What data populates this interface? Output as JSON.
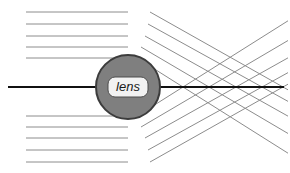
{
  "diagram": {
    "type": "optics-ray-diagram",
    "width": 290,
    "height": 173,
    "background_color": "#ffffff"
  },
  "lens": {
    "label": "lens",
    "shape": "circle",
    "center_x": 128,
    "center_y": 87,
    "radius": 32,
    "fill_color": "#7f7f7f",
    "stroke_color": "#3c3c3c",
    "stroke_width": 2,
    "label_box": {
      "fill_color": "#f2f2f2",
      "stroke_color": "#4d4d4d",
      "x": 108,
      "y": 77,
      "width": 40,
      "height": 20,
      "corner_radius": 7
    }
  },
  "axis": {
    "name": "optical-axis",
    "color": "#111111",
    "stroke_width": 2,
    "x_start": 8,
    "x_end": 284,
    "y": 87
  },
  "rays": {
    "color": "#8c8c8c",
    "stroke_width": 1,
    "incoming_x_start": 26,
    "lens_plane_x": 128,
    "above": [
      {
        "y": 12,
        "lens_exit_x": 150,
        "focus_x": 283
      },
      {
        "y": 24,
        "lens_exit_x": 148,
        "focus_x": 262
      },
      {
        "y": 36,
        "lens_exit_x": 145,
        "focus_x": 236
      },
      {
        "y": 47,
        "lens_exit_x": 141,
        "focus_x": 209
      },
      {
        "y": 58,
        "lens_exit_x": 137,
        "focus_x": 183
      }
    ],
    "below": [
      {
        "y": 162,
        "lens_exit_x": 150,
        "focus_x": 283
      },
      {
        "y": 150,
        "lens_exit_x": 148,
        "focus_x": 262
      },
      {
        "y": 138,
        "lens_exit_x": 145,
        "focus_x": 236
      },
      {
        "y": 127,
        "lens_exit_x": 141,
        "focus_x": 209
      },
      {
        "y": 116,
        "lens_exit_x": 137,
        "focus_x": 183
      }
    ],
    "divergence_end_x": 288
  }
}
